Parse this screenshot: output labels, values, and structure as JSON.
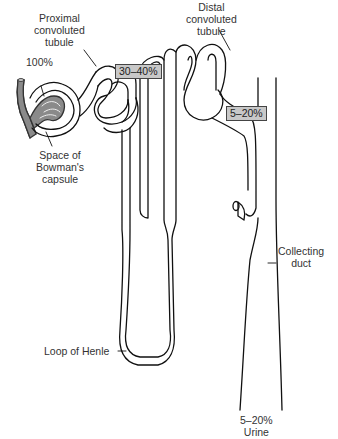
{
  "diagram": {
    "type": "nephron-filtration-diagram",
    "labels": {
      "proximal": [
        "Proximal",
        "convoluted",
        "tubule"
      ],
      "distal": [
        "Distal",
        "convoluted",
        "tubule"
      ],
      "bowman": [
        "Space of",
        "Bowman's",
        "capsule"
      ],
      "henle": "Loop of Henle",
      "collecting": [
        "Collecting",
        "duct"
      ],
      "urine": [
        "5–20%",
        "Urine"
      ]
    },
    "percentages": {
      "glomerulus": "100%",
      "after_proximal": "30–40%",
      "after_distal": "5–20%"
    },
    "colors": {
      "line": "#111111",
      "glomerulus_fill": "#8a8a8a",
      "box_fill": "#c8c8c8",
      "background": "#ffffff"
    }
  }
}
